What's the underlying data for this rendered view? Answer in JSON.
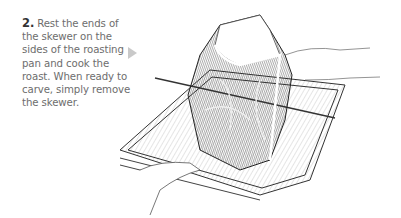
{
  "step": {
    "number": "2.",
    "text": "Rest the ends of the skewer on the sides of the roasting pan and cook the roast. When ready to carve, simply remove the skewer."
  },
  "arrow": {
    "icon": "triangle-right-icon",
    "color": "#c9c9c9"
  },
  "illustration": {
    "subject": "roast-on-skewer-in-roasting-pan",
    "style": "pen-and-ink"
  }
}
